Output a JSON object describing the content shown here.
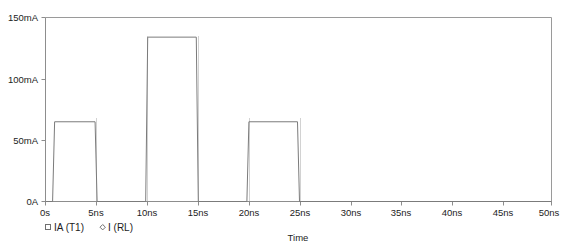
{
  "chart_data": {
    "type": "line",
    "title": "",
    "xlabel": "Time",
    "ylabel": "",
    "xlim": [
      0,
      50
    ],
    "ylim": [
      0,
      150
    ],
    "x_unit": "ns",
    "y_unit": "mA",
    "grid": false,
    "legend_position": "below-left",
    "x_ticks": [
      0,
      5,
      10,
      15,
      20,
      25,
      30,
      35,
      40,
      45,
      50
    ],
    "x_tick_labels": [
      "0s",
      "5ns",
      "10ns",
      "15ns",
      "20ns",
      "25ns",
      "30ns",
      "35ns",
      "40ns",
      "45ns",
      "50ns"
    ],
    "y_ticks": [
      0,
      50,
      100,
      150
    ],
    "y_tick_labels": [
      "0A",
      "50mA",
      "100mA",
      "150mA"
    ],
    "series": [
      {
        "name": "IA (T1)",
        "marker": "square",
        "color": "#7b7b7b",
        "points": [
          [
            0.0,
            0
          ],
          [
            0.7,
            0
          ],
          [
            0.9,
            65
          ],
          [
            4.9,
            65
          ],
          [
            5.1,
            0
          ],
          [
            9.9,
            0
          ],
          [
            10.1,
            134
          ],
          [
            14.9,
            134
          ],
          [
            15.1,
            0
          ],
          [
            19.9,
            0
          ],
          [
            20.1,
            65
          ],
          [
            24.9,
            65
          ],
          [
            25.1,
            0
          ],
          [
            50.0,
            0
          ]
        ]
      },
      {
        "name": "I (RL)",
        "marker": "diamond",
        "color": "#7b7b7b",
        "points": []
      }
    ],
    "annotations": []
  },
  "legend": {
    "entries": [
      {
        "marker_icon": "square-marker-icon",
        "label": "IA (T1)"
      },
      {
        "marker_icon": "diamond-marker-icon",
        "label": "I (RL)"
      }
    ]
  },
  "axis_titles": {
    "x": "Time"
  }
}
